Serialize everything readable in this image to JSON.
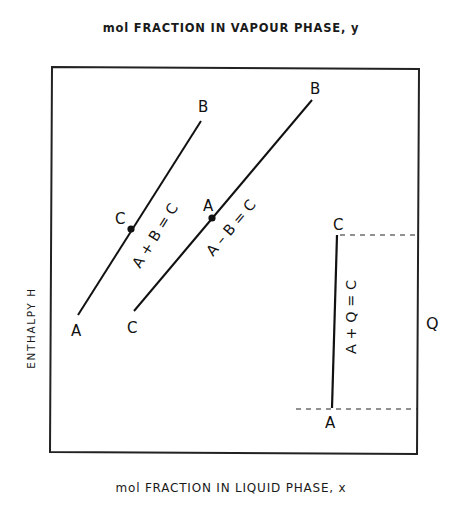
{
  "labels": {
    "top_axis": "mol FRACTION IN VAPOUR PHASE,  y",
    "bottom_axis": "mol FRACTION IN LIQUID PHASE,  x",
    "left_axis": "ENTHALPY  H",
    "right_quantity": "Q"
  },
  "diagram": {
    "frame": {
      "x1": 51,
      "y1": 67,
      "x2": 418,
      "y2": 453
    },
    "addition_line": {
      "equation": "A + B = C",
      "start_label": "A",
      "end_label": "B",
      "point_label": "C"
    },
    "subtraction_line": {
      "equation": "A – B = C",
      "start_label": "C",
      "end_label": "B",
      "point_label": "A"
    },
    "heat_line": {
      "equation": "A + Q = C",
      "bottom_label": "A",
      "top_label": "C",
      "heat_label": "Q"
    }
  }
}
